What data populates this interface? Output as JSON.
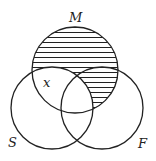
{
  "diagram": {
    "type": "venn",
    "sets": [
      {
        "id": "M",
        "label": "M",
        "cx": 75,
        "cy": 70,
        "r": 43
      },
      {
        "id": "S",
        "label": "S",
        "cx": 52,
        "cy": 108,
        "r": 41
      },
      {
        "id": "F",
        "label": "F",
        "cx": 102,
        "cy": 108,
        "r": 41
      }
    ],
    "shaded_region": "M minus S (horizontal hatching)",
    "region_label": "x",
    "colors": {
      "stroke": "#222222",
      "hatch": "#222222",
      "background": "#ffffff"
    }
  }
}
